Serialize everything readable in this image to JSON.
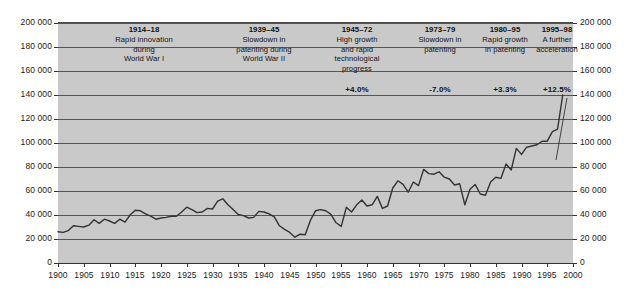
{
  "chart_data": {
    "type": "line",
    "title": "",
    "xlabel": "",
    "ylabel": "",
    "xlim": [
      1900,
      2000
    ],
    "ylim": [
      0,
      200000
    ],
    "grid": true,
    "legend_position": "none",
    "y_ticks": [
      "0",
      "20 000",
      "40 000",
      "60 000",
      "80 000",
      "100 000",
      "120 000",
      "140 000",
      "160 000",
      "180 000",
      "200 000"
    ],
    "y_tick_values": [
      0,
      20000,
      40000,
      60000,
      80000,
      100000,
      120000,
      140000,
      160000,
      180000,
      200000
    ],
    "x_ticks": [
      "1900",
      "1905",
      "1910",
      "1915",
      "1920",
      "1925",
      "1930",
      "1935",
      "1940",
      "1945",
      "1950",
      "1955",
      "1960",
      "1965",
      "1970",
      "1975",
      "1980",
      "1985",
      "1990",
      "1995",
      "2000"
    ],
    "x_tick_values": [
      1900,
      1905,
      1910,
      1915,
      1920,
      1925,
      1930,
      1935,
      1940,
      1945,
      1950,
      1955,
      1960,
      1965,
      1970,
      1975,
      1980,
      1985,
      1990,
      1995,
      2000
    ],
    "series": [
      {
        "name": "Patents granted",
        "x": [
          1900,
          1901,
          1902,
          1903,
          1904,
          1905,
          1906,
          1907,
          1908,
          1909,
          1910,
          1911,
          1912,
          1913,
          1914,
          1915,
          1916,
          1917,
          1918,
          1919,
          1920,
          1921,
          1922,
          1923,
          1924,
          1925,
          1926,
          1927,
          1928,
          1929,
          1930,
          1931,
          1932,
          1933,
          1934,
          1935,
          1936,
          1937,
          1938,
          1939,
          1940,
          1941,
          1942,
          1943,
          1944,
          1945,
          1946,
          1947,
          1948,
          1949,
          1950,
          1951,
          1952,
          1953,
          1954,
          1955,
          1956,
          1957,
          1958,
          1959,
          1960,
          1961,
          1962,
          1963,
          1964,
          1965,
          1966,
          1967,
          1968,
          1969,
          1970,
          1971,
          1972,
          1973,
          1974,
          1975,
          1976,
          1977,
          1978,
          1979,
          1980,
          1981,
          1982,
          1983,
          1984,
          1985,
          1986,
          1987,
          1988,
          1989,
          1990,
          1991,
          1992,
          1993,
          1994,
          1995,
          1996,
          1997,
          1998
        ],
        "values": [
          26000,
          25500,
          27000,
          31000,
          30500,
          30000,
          31500,
          36000,
          33000,
          36500,
          35000,
          33000,
          36500,
          34000,
          40000,
          44000,
          43500,
          41000,
          39000,
          36500,
          37500,
          38000,
          39000,
          39000,
          42500,
          46500,
          44500,
          42000,
          42500,
          45500,
          45000,
          51500,
          53500,
          48500,
          44500,
          40500,
          39500,
          37500,
          38000,
          43000,
          42500,
          41000,
          38500,
          31000,
          28000,
          25500,
          21500,
          24000,
          23500,
          35500,
          43500,
          44500,
          43500,
          40500,
          33500,
          30500,
          46500,
          42500,
          48500,
          52500,
          47500,
          48500,
          55500,
          45500,
          47500,
          62500,
          68500,
          65500,
          59000,
          67500,
          64500,
          78000,
          74500,
          74000,
          76000,
          71500,
          70000,
          65000,
          66000,
          48500,
          61500,
          65500,
          57500,
          56500,
          67500,
          71500,
          70500,
          82500,
          77500,
          95500,
          90500,
          96500,
          97500,
          98500,
          101500,
          101500,
          109500,
          111500,
          140000
        ],
        "color": "#333333",
        "line_width": 1.4
      }
    ],
    "annotations": [
      {
        "id": "period-1",
        "period": "1914–18",
        "lines": [
          "Rapid innovation",
          "during",
          "World War I"
        ],
        "rate": ""
      },
      {
        "id": "period-2",
        "period": "1939–45",
        "lines": [
          "Slowdown in",
          "patenting during",
          "World War II"
        ],
        "rate": ""
      },
      {
        "id": "period-3",
        "period": "1945–72",
        "lines": [
          "High growth",
          "and rapid",
          "technological",
          "progress"
        ],
        "rate": "+4.0%"
      },
      {
        "id": "period-4",
        "period": "1973–79",
        "lines": [
          "Slowdown in",
          "patenting"
        ],
        "rate": "-7.0%"
      },
      {
        "id": "period-5",
        "period": "1980–95",
        "lines": [
          "Rapid growth",
          "in patenting"
        ],
        "rate": "+3.3%"
      },
      {
        "id": "period-6",
        "period": "1995–98",
        "lines": [
          "A further",
          "acceleration"
        ],
        "rate": "+12.5%"
      }
    ]
  },
  "style": {
    "plot_background": "#c9c9c9",
    "page_background": "#ffffff",
    "gridline_color": "#555555",
    "line_color": "#333333",
    "text_color": "#111111"
  }
}
